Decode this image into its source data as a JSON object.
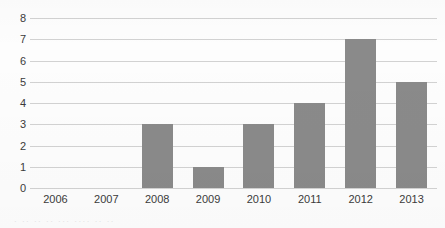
{
  "chart_data": {
    "type": "bar",
    "title": "",
    "subtitle": "",
    "xlabel": "",
    "ylabel": "",
    "categories": [
      "2006",
      "2007",
      "2008",
      "2009",
      "2010",
      "2011",
      "2012",
      "2013"
    ],
    "values": [
      0,
      0,
      3,
      1,
      3,
      4,
      7,
      5
    ],
    "ylim": [
      0,
      8
    ],
    "yticks": [
      "8",
      "7",
      "6",
      "5",
      "4",
      "3",
      "2",
      "1",
      "0"
    ],
    "ytick_values": [
      8,
      7,
      6,
      5,
      4,
      3,
      2,
      1,
      0
    ],
    "grid": "horizontal",
    "legend": "none",
    "bar_color": "#8a8a8a",
    "grid_color": "#d2d2d2",
    "axis_text_color": "#3b3b3b",
    "background_color": "#fdfdfd",
    "annotations": []
  },
  "caption": {
    "fragment_text": "· ·· ·· ·· ··· ···· ·· ··"
  }
}
